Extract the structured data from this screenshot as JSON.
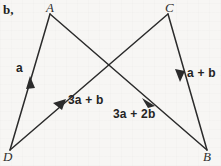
{
  "figure": {
    "part_label": "b,",
    "background_color": "#f7f6f4",
    "ink_color": "#2b2b2b",
    "vertices": [
      {
        "name": "A",
        "label": "A",
        "x": 50,
        "y": 14
      },
      {
        "name": "C",
        "label": "C",
        "x": 168,
        "y": 14
      },
      {
        "name": "D",
        "label": "D",
        "x": 10,
        "y": 150
      },
      {
        "name": "B",
        "label": "B",
        "x": 207,
        "y": 150
      }
    ],
    "segments": [
      {
        "name": "segment-d-a",
        "from": "D",
        "to": "A",
        "arrow": "to"
      },
      {
        "name": "segment-d-c",
        "from": "D",
        "to": "C",
        "arrow": "to"
      },
      {
        "name": "segment-a-b",
        "from": "A",
        "to": "B",
        "arrow": "to"
      },
      {
        "name": "segment-c-b",
        "from": "C",
        "to": "B",
        "arrow": "to"
      }
    ],
    "vector_labels": [
      {
        "name": "vector-label-a",
        "text": "a",
        "x": 16,
        "y": 68
      },
      {
        "name": "vector-label-3a-b",
        "text": "3a + b",
        "x": 68,
        "y": 99
      },
      {
        "name": "vector-label-3a-2b",
        "text": "3a + 2b",
        "x": 113,
        "y": 112
      },
      {
        "name": "vector-label-a-b",
        "text": "a + b",
        "x": 186,
        "y": 71
      }
    ]
  }
}
